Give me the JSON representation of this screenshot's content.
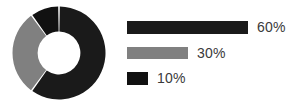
{
  "chart_data": {
    "type": "pie",
    "variant": "donut",
    "title": "",
    "subtitle": "",
    "xlabel": "",
    "ylabel": "",
    "grid": false,
    "legend_position": "right",
    "legend_style": "proportional-bars",
    "value_unit": "%",
    "hole_ratio": 0.46,
    "start_angle_deg": 0,
    "direction": "clockwise",
    "slice_gap_deg": 2,
    "categories": [
      "60%",
      "30%",
      "10%"
    ],
    "values": [
      60,
      30,
      10
    ],
    "colors": [
      "#1a1a1a",
      "#808080",
      "#111111"
    ],
    "slices": [
      {
        "label": "60%",
        "value": 60,
        "color": "#1a1a1a",
        "bar_width_px": 121
      },
      {
        "label": "30%",
        "value": 30,
        "color": "#808080",
        "bar_width_px": 61
      },
      {
        "label": "10%",
        "value": 10,
        "color": "#111111",
        "bar_width_px": 21
      }
    ]
  },
  "legend": {
    "items": [
      {
        "label": "60%",
        "color": "#1a1a1a",
        "bar_width_px": 121
      },
      {
        "label": "30%",
        "color": "#808080",
        "bar_width_px": 61
      },
      {
        "label": "10%",
        "color": "#111111",
        "bar_width_px": 21
      }
    ]
  },
  "figure": {
    "background": "#ffffff",
    "text_color": "#3a3a3a"
  }
}
